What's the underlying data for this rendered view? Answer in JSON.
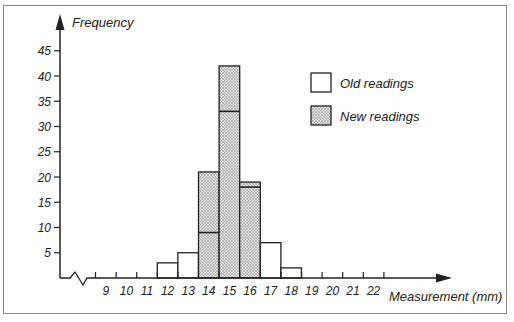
{
  "chart_data": {
    "type": "bar",
    "subtype": "stacked-histogram",
    "title": "",
    "ylabel": "Frequency",
    "xlabel": "Measurement (mm)",
    "ylim": [
      0,
      48
    ],
    "y_ticks": [
      5,
      10,
      15,
      20,
      25,
      30,
      35,
      40,
      45
    ],
    "x_tick_labels": [
      "9",
      "10",
      "11",
      "12",
      "13",
      "14",
      "15",
      "16",
      "17",
      "18",
      "19",
      "20",
      "21",
      "22"
    ],
    "x_axis_break": true,
    "grid": false,
    "legend": {
      "placement": "top-right",
      "entries": [
        {
          "name": "Old readings",
          "fill": "white"
        },
        {
          "name": "New readings",
          "fill": "stippled"
        }
      ]
    },
    "categories": [
      "12",
      "13",
      "14",
      "15",
      "16",
      "17",
      "18"
    ],
    "series": [
      {
        "name": "Old readings",
        "values": [
          3,
          5,
          9,
          33,
          18,
          7,
          2
        ]
      },
      {
        "name": "New readings",
        "values": [
          0,
          0,
          12,
          9,
          1,
          0,
          0
        ]
      }
    ],
    "totals": [
      3,
      5,
      21,
      42,
      19,
      7,
      2
    ]
  },
  "colors": {
    "axis": "#222222",
    "stipple_bg": "#e6e6e6",
    "stipple_dot": "#6a6a6a",
    "frame": "#8a8a8a"
  }
}
